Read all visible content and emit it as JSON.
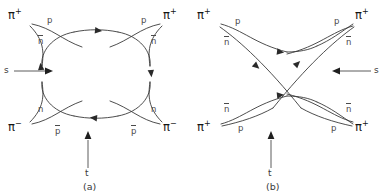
{
  "figure": {
    "background_color": "#ffffff",
    "line_color": "#3a3a3a",
    "text_color": "#3a3a3a"
  },
  "panels": [
    {
      "id": "a",
      "caption": "(a)",
      "mandelstam_s": {
        "label": "s",
        "direction": "right"
      },
      "mandelstam_t": {
        "label": "t",
        "direction": "up"
      },
      "external_particles": [
        {
          "position": "top-left",
          "label": "π",
          "charge": "+"
        },
        {
          "position": "top-right",
          "label": "π",
          "charge": "+"
        },
        {
          "position": "bottom-left",
          "label": "π",
          "charge": "−"
        },
        {
          "position": "bottom-right",
          "label": "π",
          "charge": "−"
        }
      ],
      "quark_labels": [
        {
          "position": "top-left-upper",
          "text": "p",
          "overline": false
        },
        {
          "position": "top-left-lower",
          "text": "n",
          "overline": true
        },
        {
          "position": "top-right-upper",
          "text": "p",
          "overline": false
        },
        {
          "position": "top-right-lower",
          "text": "n",
          "overline": true
        },
        {
          "position": "bottom-left-upper",
          "text": "n",
          "overline": false
        },
        {
          "position": "bottom-left-lower",
          "text": "p",
          "overline": true
        },
        {
          "position": "bottom-right-upper",
          "text": "n",
          "overline": false
        },
        {
          "position": "bottom-right-lower",
          "text": "p",
          "overline": true
        }
      ]
    },
    {
      "id": "b",
      "caption": "(b)",
      "mandelstam_s": {
        "label": "s",
        "direction": "left"
      },
      "mandelstam_t": {
        "label": "t",
        "direction": "up"
      },
      "external_particles": [
        {
          "position": "top-left",
          "label": "π",
          "charge": "+"
        },
        {
          "position": "top-right",
          "label": "π",
          "charge": "+"
        },
        {
          "position": "bottom-left",
          "label": "π",
          "charge": "+"
        },
        {
          "position": "bottom-right",
          "label": "π",
          "charge": "+"
        }
      ],
      "quark_labels": [
        {
          "position": "top-left-upper",
          "text": "p",
          "overline": false
        },
        {
          "position": "top-left-lower",
          "text": "n",
          "overline": true
        },
        {
          "position": "top-right-upper",
          "text": "p",
          "overline": false
        },
        {
          "position": "top-right-lower",
          "text": "n",
          "overline": true
        },
        {
          "position": "bottom-left-upper",
          "text": "n",
          "overline": true
        },
        {
          "position": "bottom-left-lower",
          "text": "p",
          "overline": false
        },
        {
          "position": "bottom-right-upper",
          "text": "n",
          "overline": true
        },
        {
          "position": "bottom-right-lower",
          "text": "p",
          "overline": false
        }
      ]
    }
  ],
  "text": {
    "pi": "π",
    "plus": "+",
    "minus": "−",
    "p": "p",
    "n": "n",
    "s": "s",
    "t": "t",
    "caption_a": "(a)",
    "caption_b": "(b)"
  }
}
